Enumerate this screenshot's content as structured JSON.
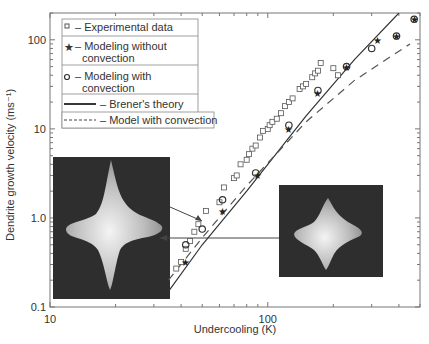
{
  "chart_data": {
    "type": "scatter",
    "title": "",
    "xlabel": "Undercooling (K)",
    "ylabel": "Dendrite growth velocity (ms⁻¹)",
    "xscale": "log",
    "yscale": "log",
    "xlim": [
      10,
      500
    ],
    "ylim": [
      0.1,
      200
    ],
    "x_ticks": [
      "10",
      "100"
    ],
    "y_ticks": [
      "0.1",
      "1.0",
      "10",
      "100"
    ],
    "grid": false,
    "legend_position": "upper left",
    "legend": [
      "□ – Experimental data",
      "★ – Modeling without convection",
      "○ – Modeling with convection",
      "— Brener's theory",
      "- - - Model with convection"
    ],
    "series": [
      {
        "name": "Experimental data",
        "marker": "square",
        "x": [
          38,
          40,
          42,
          44,
          46,
          48,
          52,
          60,
          63,
          70,
          72,
          75,
          80,
          82,
          85,
          88,
          92,
          95,
          100,
          102,
          105,
          110,
          115,
          120,
          125,
          130,
          140,
          145,
          150,
          160,
          165,
          170,
          175,
          200,
          210
        ],
        "y": [
          0.27,
          0.32,
          0.45,
          0.55,
          0.7,
          0.85,
          1.2,
          1.5,
          2.2,
          2.8,
          3.0,
          4.0,
          4.5,
          5.2,
          6.0,
          6.5,
          8.0,
          9.5,
          10,
          11,
          12,
          13,
          15,
          18,
          20,
          22,
          28,
          30,
          32,
          38,
          42,
          45,
          55,
          48,
          40
        ]
      },
      {
        "name": "Modeling without convection",
        "marker": "star",
        "x": [
          42,
          62,
          90,
          125,
          170,
          230,
          320,
          390,
          470
        ],
        "y": [
          0.32,
          1.2,
          3.0,
          10,
          25,
          50,
          100,
          110,
          170
        ]
      },
      {
        "name": "Modeling with convection",
        "marker": "circle",
        "x": [
          42,
          50,
          62,
          88,
          125,
          170,
          230,
          300,
          390,
          470
        ],
        "y": [
          0.5,
          0.75,
          1.6,
          3.2,
          11,
          27,
          50,
          80,
          110,
          170
        ]
      },
      {
        "name": "Brener's theory",
        "style": "solid",
        "x": [
          35,
          50,
          80,
          150,
          250,
          400
        ],
        "y": [
          0.15,
          0.5,
          2.0,
          14,
          60,
          200
        ]
      },
      {
        "name": "Model with convection",
        "style": "dashed",
        "x": [
          35,
          50,
          80,
          150,
          250,
          450
        ],
        "y": [
          0.2,
          0.6,
          2.3,
          12,
          35,
          90
        ]
      }
    ],
    "annotations": [
      "Dendrite shape without convection (left inset)",
      "Dendrite shape with convection (right inset)"
    ]
  }
}
